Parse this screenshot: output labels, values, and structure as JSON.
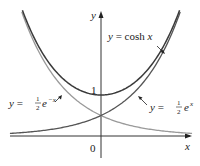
{
  "chart_data": {
    "type": "line",
    "title": "",
    "xlabel": "x",
    "ylabel": "y",
    "grid": false,
    "legend": "inline annotations",
    "xlim": [
      -2.07,
      2.2
    ],
    "ylim": [
      -0.15,
      3.3
    ],
    "y_ticks": [
      {
        "value": 1,
        "label": "1"
      }
    ],
    "origin_label": "0",
    "series": [
      {
        "name": "y = cosh x",
        "fn": "cosh",
        "color": "#3a3a3a",
        "x_range": [
          -1.88,
          1.88
        ],
        "points": [
          [
            -1.88,
            3.35
          ],
          [
            -1.5,
            2.35
          ],
          [
            -1,
            1.54
          ],
          [
            -0.5,
            1.13
          ],
          [
            0,
            1
          ],
          [
            0.5,
            1.13
          ],
          [
            1,
            1.54
          ],
          [
            1.5,
            2.35
          ],
          [
            1.88,
            3.35
          ]
        ]
      },
      {
        "name": "y = 1/2 e^x",
        "fn": "halfexp",
        "color": "#555555",
        "x_range": [
          -2.07,
          1.9
        ],
        "points": [
          [
            -2,
            0.07
          ],
          [
            -1,
            0.18
          ],
          [
            0,
            0.5
          ],
          [
            1,
            1.36
          ],
          [
            1.9,
            3.34
          ]
        ]
      },
      {
        "name": "y = 1/2 e^-x",
        "fn": "halfexpneg",
        "color": "#9a9a9a",
        "x_range": [
          -1.9,
          2.07
        ],
        "points": [
          [
            -1.9,
            3.34
          ],
          [
            -1,
            1.36
          ],
          [
            0,
            0.5
          ],
          [
            1,
            0.18
          ],
          [
            2,
            0.07
          ]
        ]
      }
    ],
    "annotations": [
      {
        "text_main": "y = cosh x",
        "target_series": "cosh"
      },
      {
        "text_prefix": "y = ",
        "frac_num": "1",
        "frac_den": "2",
        "text_base": "e",
        "text_exp": "−x",
        "target_series": "halfexpneg"
      },
      {
        "text_prefix": "y = ",
        "frac_num": "1",
        "frac_den": "2",
        "text_base": "e",
        "text_exp": "x",
        "target_series": "halfexp"
      }
    ]
  },
  "labels": {
    "y_axis": "y",
    "x_axis": "x",
    "origin": "0",
    "tick_one": "1",
    "cosh_prefix": "y = ",
    "cosh_fn": "cosh ",
    "cosh_var": "x",
    "neg_prefix": "y = ",
    "neg_num": "1",
    "neg_den": "2",
    "neg_base": "e",
    "neg_exp": "−x",
    "pos_prefix": "y = ",
    "pos_num": "1",
    "pos_den": "2",
    "pos_base": "e",
    "pos_exp": "x"
  }
}
